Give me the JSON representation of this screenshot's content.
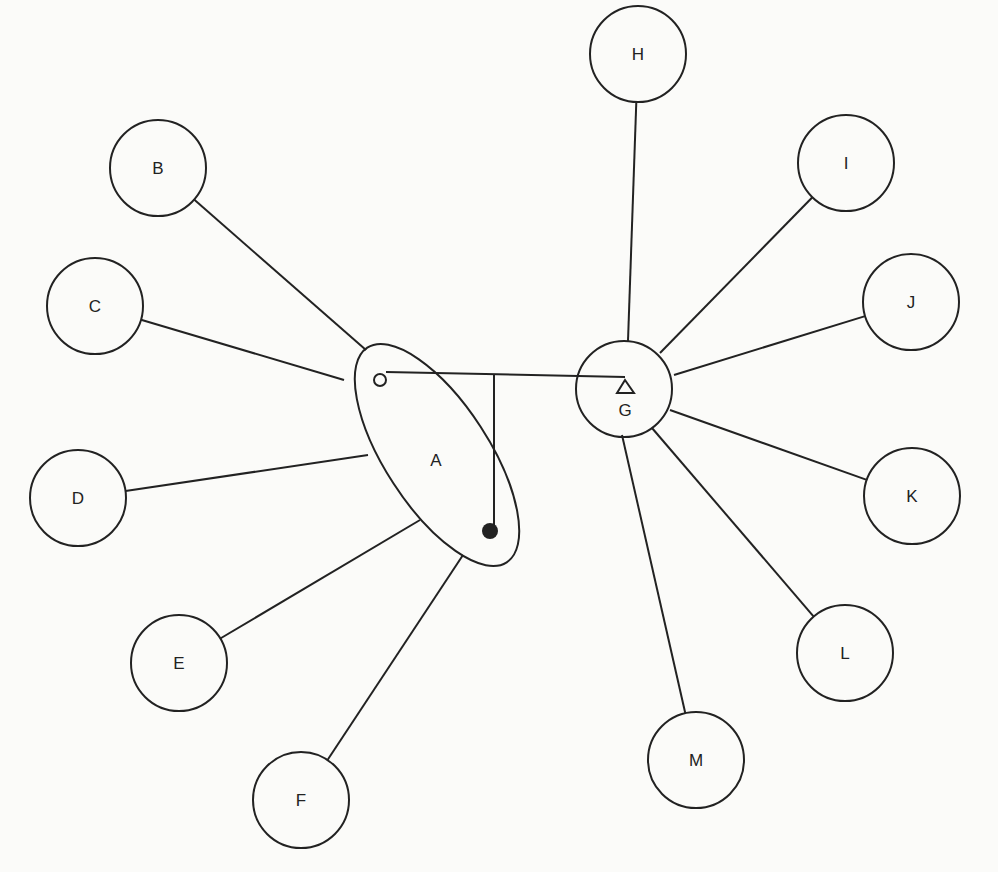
{
  "diagram": {
    "stroke": "#222222",
    "background": "#fbfbf9",
    "hubs": {
      "A": {
        "label": "A",
        "shape": "ellipse",
        "cx": 437,
        "cy": 455,
        "rx": 52,
        "ry": 128,
        "rotate": -33,
        "label_x": 436,
        "label_y": 466
      },
      "G": {
        "label": "G",
        "shape": "circle",
        "cx": 624,
        "cy": 389,
        "r": 48,
        "label_x": 625,
        "label_y": 416
      }
    },
    "markers": {
      "open_circle": {
        "cx": 380,
        "cy": 380,
        "r": 6
      },
      "filled_circle": {
        "cx": 490,
        "cy": 531,
        "r": 8
      },
      "triangle": {
        "points": "625,380 617,393 634,393"
      }
    },
    "connector": {
      "horizontal": {
        "x1": 386,
        "y1": 372,
        "x2": 625,
        "y2": 377
      },
      "vertical": {
        "x1": 494,
        "y1": 375,
        "x2": 494,
        "y2": 525
      }
    },
    "nodes": [
      {
        "id": "B",
        "label": "B",
        "cx": 158,
        "cy": 168,
        "r": 48,
        "hub": "A",
        "ex": 366,
        "ey": 350
      },
      {
        "id": "C",
        "label": "C",
        "cx": 95,
        "cy": 306,
        "r": 48,
        "hub": "A",
        "ex": 344,
        "ey": 380
      },
      {
        "id": "D",
        "label": "D",
        "cx": 78,
        "cy": 498,
        "r": 48,
        "hub": "A",
        "ex": 368,
        "ey": 455
      },
      {
        "id": "E",
        "label": "E",
        "cx": 179,
        "cy": 663,
        "r": 48,
        "hub": "A",
        "ex": 420,
        "ey": 520
      },
      {
        "id": "F",
        "label": "F",
        "cx": 301,
        "cy": 800,
        "r": 48,
        "hub": "A",
        "ex": 463,
        "ey": 555
      },
      {
        "id": "H",
        "label": "H",
        "cx": 638,
        "cy": 54,
        "r": 48,
        "hub": "G",
        "ex": 628,
        "ey": 341
      },
      {
        "id": "I",
        "label": "I",
        "cx": 846,
        "cy": 163,
        "r": 48,
        "hub": "G",
        "ex": 660,
        "ey": 353
      },
      {
        "id": "J",
        "label": "J",
        "cx": 911,
        "cy": 302,
        "r": 48,
        "hub": "G",
        "ex": 674,
        "ey": 375
      },
      {
        "id": "K",
        "label": "K",
        "cx": 912,
        "cy": 496,
        "r": 48,
        "hub": "G",
        "ex": 670,
        "ey": 410
      },
      {
        "id": "L",
        "label": "L",
        "cx": 845,
        "cy": 653,
        "r": 48,
        "hub": "G",
        "ex": 652,
        "ey": 428
      },
      {
        "id": "M",
        "label": "M",
        "cx": 696,
        "cy": 760,
        "r": 48,
        "hub": "G",
        "ex": 622,
        "ey": 435
      }
    ]
  }
}
